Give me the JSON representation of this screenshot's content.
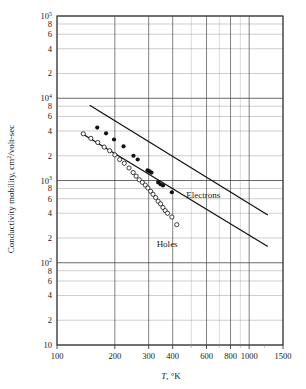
{
  "figure": {
    "background": "#ffffff",
    "frame_color": "#3a3a3a",
    "grid_color": "#8a8a8a",
    "data_color": "#111111"
  },
  "chart_data": {
    "type": "scatter",
    "title": "",
    "xlabel": "T, °K",
    "ylabel": "Conductivity mobility, cm2/volt-sec",
    "xscale": "log",
    "yscale": "log",
    "xlim": [
      100,
      1500
    ],
    "ylim": [
      10,
      100000
    ],
    "grid": true,
    "legend_position": "inline-annotation",
    "xticks": [
      100,
      200,
      300,
      400,
      600,
      800,
      1000,
      1500
    ],
    "xtick_labels": [
      "100",
      "200",
      "300",
      "400",
      "600",
      "800",
      "1000",
      "1500"
    ],
    "yticks": [
      10,
      20,
      40,
      60,
      80,
      100,
      200,
      400,
      600,
      800,
      1000,
      2000,
      4000,
      6000,
      8000,
      10000,
      20000,
      40000,
      60000,
      80000,
      100000
    ],
    "ytick_labels": [
      "10",
      "2",
      "4",
      "6",
      "8",
      "10^2",
      "2",
      "4",
      "6",
      "8",
      "10^3",
      "2",
      "4",
      "6",
      "8",
      "10^4",
      "2",
      "4",
      "6",
      "8",
      "10^5"
    ],
    "annotations": [
      {
        "text": "Electrons",
        "x": 470,
        "y": 620
      },
      {
        "text": "Holes",
        "x": 330,
        "y": 155
      }
    ],
    "series": [
      {
        "name": "Electrons",
        "marker": "filled-circle",
        "color": "#111111",
        "points": [
          {
            "x": 162,
            "y": 4400
          },
          {
            "x": 180,
            "y": 3750
          },
          {
            "x": 198,
            "y": 3150
          },
          {
            "x": 222,
            "y": 2600
          },
          {
            "x": 250,
            "y": 2000
          },
          {
            "x": 263,
            "y": 1800
          },
          {
            "x": 296,
            "y": 1330
          },
          {
            "x": 303,
            "y": 1290
          },
          {
            "x": 310,
            "y": 1250
          },
          {
            "x": 336,
            "y": 950
          },
          {
            "x": 346,
            "y": 900
          },
          {
            "x": 356,
            "y": 870
          },
          {
            "x": 396,
            "y": 720
          }
        ],
        "fit_line": {
          "x1": 148,
          "y1": 8200,
          "x2": 1250,
          "y2": 380
        }
      },
      {
        "name": "Holes",
        "marker": "open-circle",
        "color": "#111111",
        "points": [
          {
            "x": 137,
            "y": 3700
          },
          {
            "x": 150,
            "y": 3250
          },
          {
            "x": 163,
            "y": 2900
          },
          {
            "x": 176,
            "y": 2550
          },
          {
            "x": 188,
            "y": 2300
          },
          {
            "x": 200,
            "y": 2050
          },
          {
            "x": 212,
            "y": 1800
          },
          {
            "x": 224,
            "y": 1620
          },
          {
            "x": 237,
            "y": 1420
          },
          {
            "x": 249,
            "y": 1250
          },
          {
            "x": 258,
            "y": 1130
          },
          {
            "x": 268,
            "y": 1020
          },
          {
            "x": 278,
            "y": 950
          },
          {
            "x": 288,
            "y": 880
          },
          {
            "x": 297,
            "y": 810
          },
          {
            "x": 307,
            "y": 740
          },
          {
            "x": 316,
            "y": 680
          },
          {
            "x": 326,
            "y": 620
          },
          {
            "x": 336,
            "y": 560
          },
          {
            "x": 346,
            "y": 520
          },
          {
            "x": 356,
            "y": 470
          },
          {
            "x": 366,
            "y": 430
          },
          {
            "x": 376,
            "y": 400
          },
          {
            "x": 396,
            "y": 360
          },
          {
            "x": 420,
            "y": 290
          }
        ],
        "fit_line": {
          "x1": 134,
          "y1": 3750,
          "x2": 1250,
          "y2": 158
        }
      }
    ]
  }
}
